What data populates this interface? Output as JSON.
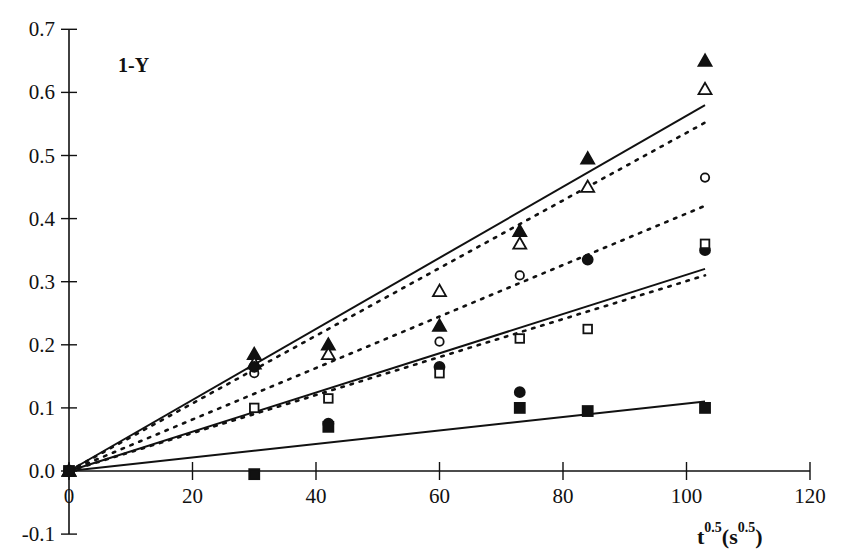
{
  "chart_data": {
    "type": "scatter",
    "title": "",
    "annotation": "1-Y",
    "xlabel": "t^0.5 (s^0.5)",
    "xlabel_main": "t",
    "xlabel_sup1": "0.5",
    "xlabel_paren": "(s",
    "xlabel_sup2": "0.5",
    "xlabel_close": ")",
    "ylabel": "1-Y",
    "xlim": [
      0,
      120
    ],
    "ylim": [
      -0.1,
      0.7
    ],
    "x_ticks": [
      0,
      20,
      40,
      60,
      80,
      100,
      120
    ],
    "x_tick_labels": [
      "0",
      "20",
      "40",
      "60",
      "80",
      "100",
      "120"
    ],
    "y_ticks": [
      0.7,
      0.6,
      0.5,
      0.4,
      0.3,
      0.2,
      0.1,
      0.0,
      -0.1
    ],
    "y_tick_labels": [
      "0.7",
      "0.6",
      "0.5",
      "0.4",
      "0.3",
      "0.2",
      "0.1",
      "0.0",
      "-0.1"
    ],
    "grid": false,
    "legend": "none",
    "x": [
      0,
      30,
      42,
      60,
      73,
      84,
      103
    ],
    "series": [
      {
        "name": "filled-triangle",
        "marker": "triangle-filled",
        "values": [
          0,
          0.185,
          0.2,
          0.23,
          0.38,
          0.495,
          0.65
        ],
        "fit": {
          "style": "solid",
          "slope": 0.00563
        }
      },
      {
        "name": "open-triangle",
        "marker": "triangle-open",
        "values": [
          0,
          0.17,
          0.185,
          0.285,
          0.36,
          0.45,
          0.605
        ],
        "fit": {
          "style": "dotted",
          "slope": 0.00536
        }
      },
      {
        "name": "open-circle",
        "marker": "circle-open",
        "values": [
          0,
          0.155,
          null,
          0.205,
          0.31,
          null,
          0.465
        ],
        "fit": {
          "style": "dotted",
          "slope": 0.00408
        }
      },
      {
        "name": "filled-circle",
        "marker": "circle-filled",
        "values": [
          0,
          0.165,
          0.075,
          0.165,
          0.125,
          0.335,
          0.35
        ],
        "fit": {
          "style": "solid",
          "slope": 0.00311
        }
      },
      {
        "name": "open-square",
        "marker": "square-open",
        "values": [
          0,
          0.1,
          0.115,
          0.155,
          0.21,
          0.225,
          0.36
        ],
        "fit": {
          "style": "dotted",
          "slope": 0.00301
        }
      },
      {
        "name": "filled-square",
        "marker": "square-filled",
        "values": [
          0,
          -0.005,
          0.07,
          null,
          0.1,
          0.095,
          0.1
        ],
        "fit": {
          "style": "solid",
          "slope": 0.00107
        }
      }
    ],
    "fit_x_range": [
      0,
      103
    ]
  },
  "colors": {
    "ink": "#111111",
    "background": "#ffffff"
  }
}
